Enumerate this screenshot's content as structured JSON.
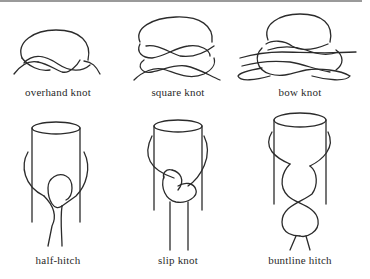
{
  "figure": {
    "knots": [
      {
        "id": "overhand",
        "label": "overhand knot",
        "row": 1,
        "col": 1
      },
      {
        "id": "square",
        "label": "square knot",
        "row": 1,
        "col": 2
      },
      {
        "id": "bow",
        "label": "bow knot",
        "row": 1,
        "col": 3
      },
      {
        "id": "half-hitch",
        "label": "half-hitch",
        "row": 2,
        "col": 1
      },
      {
        "id": "slip",
        "label": "slip knot",
        "row": 2,
        "col": 2
      },
      {
        "id": "buntline",
        "label": "buntline hitch",
        "row": 2,
        "col": 3
      }
    ],
    "colors": {
      "rope": "#2b2b2b",
      "background": "#ffffff",
      "top_rule": "#9a9a9a"
    }
  }
}
